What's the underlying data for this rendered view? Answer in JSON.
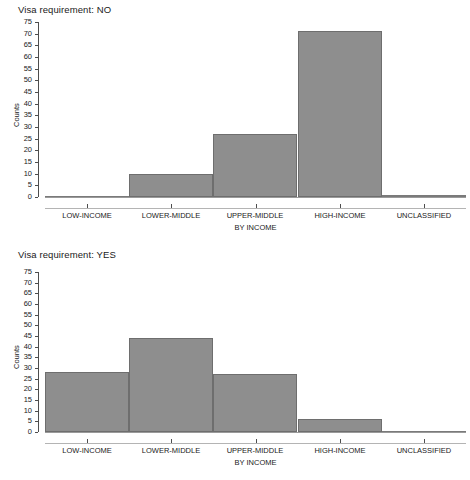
{
  "page": {
    "background": "#ffffff",
    "bar_fill": "#8e8e8e",
    "bar_stroke": "#6e6e6e",
    "axis_color": "#4d4d4d"
  },
  "panels": [
    {
      "title": "Visa requirement: NO",
      "ylabel": "Counts",
      "xlabel": "BY INCOME",
      "categories": [
        "LOW-INCOME",
        "LOWER-MIDDLE",
        "UPPER-MIDDLE",
        "HIGH-INCOME",
        "UNCLASSIFIED"
      ],
      "values": [
        0,
        10,
        27,
        71,
        1
      ],
      "yticks": [
        0,
        5,
        10,
        15,
        20,
        25,
        30,
        35,
        40,
        45,
        50,
        55,
        60,
        65,
        70,
        75
      ]
    },
    {
      "title": "Visa requirement: YES",
      "ylabel": "Counts",
      "xlabel": "BY INCOME",
      "categories": [
        "LOW-INCOME",
        "LOWER-MIDDLE",
        "UPPER-MIDDLE",
        "HIGH-INCOME",
        "UNCLASSIFIED"
      ],
      "values": [
        28,
        44,
        27,
        6,
        0
      ],
      "yticks": [
        0,
        5,
        10,
        15,
        20,
        25,
        30,
        35,
        40,
        45,
        50,
        55,
        60,
        65,
        70,
        75
      ]
    }
  ],
  "chart_data": [
    {
      "type": "bar",
      "title": "Visa requirement: NO",
      "categories": [
        "LOW-INCOME",
        "LOWER-MIDDLE",
        "UPPER-MIDDLE",
        "HIGH-INCOME",
        "UNCLASSIFIED"
      ],
      "values": [
        0,
        10,
        27,
        71,
        1
      ],
      "xlabel": "BY INCOME",
      "ylabel": "Counts",
      "ylim": [
        0,
        75
      ],
      "ytick_step": 5,
      "grid": false,
      "legend": false
    },
    {
      "type": "bar",
      "title": "Visa requirement: YES",
      "categories": [
        "LOW-INCOME",
        "LOWER-MIDDLE",
        "UPPER-MIDDLE",
        "HIGH-INCOME",
        "UNCLASSIFIED"
      ],
      "values": [
        28,
        44,
        27,
        6,
        0
      ],
      "xlabel": "BY INCOME",
      "ylabel": "Counts",
      "ylim": [
        0,
        75
      ],
      "ytick_step": 5,
      "grid": false,
      "legend": false
    }
  ]
}
